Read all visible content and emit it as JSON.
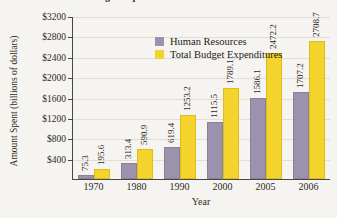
{
  "chart_data": {
    "type": "bar",
    "title": "Total Budget Expenditures vs. Human Resources",
    "xlabel": "Year",
    "ylabel": "Amount Spent (billions of dollars)",
    "categories": [
      "1970",
      "1980",
      "1990",
      "2000",
      "2005",
      "2006"
    ],
    "series": [
      {
        "name": "Human Resources",
        "color": "#9d92ad",
        "values": [
          75.3,
          313.4,
          619.4,
          1115.5,
          1586.1,
          1707.2
        ]
      },
      {
        "name": "Total Budget Expenditures",
        "color": "#f4d42c",
        "values": [
          195.6,
          590.9,
          1253.2,
          1789.1,
          2472.2,
          2708.7
        ]
      }
    ],
    "ylim": [
      0,
      3200
    ],
    "yticks": [
      400,
      800,
      1200,
      1600,
      2000,
      2400,
      2800,
      3200
    ],
    "ytick_labels": [
      "$400",
      "$800",
      "$1200",
      "$1600",
      "$2000",
      "$2400",
      "$2800",
      "$3200"
    ],
    "grid": true,
    "legend_position": "top-left"
  }
}
